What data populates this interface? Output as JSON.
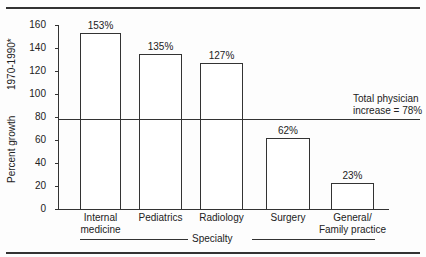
{
  "chart_data": {
    "type": "bar",
    "title": "",
    "categories": [
      "Internal medicine",
      "Pediatrics",
      "Radiology",
      "Surgery",
      "General/ Family practice"
    ],
    "category_lines": [
      [
        "Internal",
        "medicine"
      ],
      [
        "Pediatrics"
      ],
      [
        "Radiology"
      ],
      [
        "Surgery"
      ],
      [
        "General/",
        "Family practice"
      ]
    ],
    "values": [
      153,
      135,
      127,
      62,
      23
    ],
    "value_labels": [
      "153%",
      "135%",
      "127%",
      "62%",
      "23%"
    ],
    "xlabel": "Specialty",
    "ylabel": "Percent  growth   1970-1990*",
    "ylabel_main": "Percent  growth",
    "ylabel_sub": "1970-1990*",
    "ylim": [
      0,
      160
    ],
    "yticks": [
      0,
      20,
      40,
      60,
      80,
      100,
      120,
      140,
      160
    ],
    "reference_line": {
      "value": 78,
      "label_line1": "Total physician",
      "label_line2": "increase = 78%"
    },
    "grid": false,
    "legend": null
  }
}
